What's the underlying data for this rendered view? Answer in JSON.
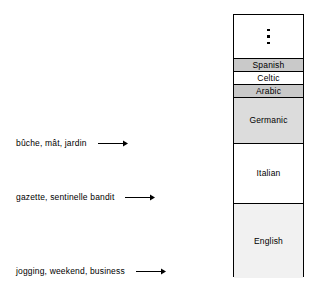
{
  "diagram": {
    "annotations": [
      {
        "label": "bûche, mât, jardin",
        "arrow": "arrow-right-icon"
      },
      {
        "label": "gazette, sentinelle bandit",
        "arrow": "arrow-right-icon"
      },
      {
        "label": "jogging, weekend, business",
        "arrow": "arrow-right-icon"
      }
    ],
    "column": {
      "border_color": "#000000",
      "strata": [
        {
          "label": "",
          "glyph": "⋮",
          "fill": "#ffffff",
          "height_px": 44
        },
        {
          "label": "Spanish",
          "fill": "#c9c9c9",
          "height_px": 13
        },
        {
          "label": "Celtic",
          "fill": "#ffffff",
          "height_px": 13
        },
        {
          "label": "Arabic",
          "fill": "#c9c9c9",
          "height_px": 13
        },
        {
          "label": "Germanic",
          "fill": "#dcdcdc",
          "height_px": 46
        },
        {
          "label": "Italian",
          "fill": "#ffffff",
          "height_px": 60
        },
        {
          "label": "English",
          "fill": "#f1f1f1",
          "height_px": 74
        }
      ]
    }
  }
}
